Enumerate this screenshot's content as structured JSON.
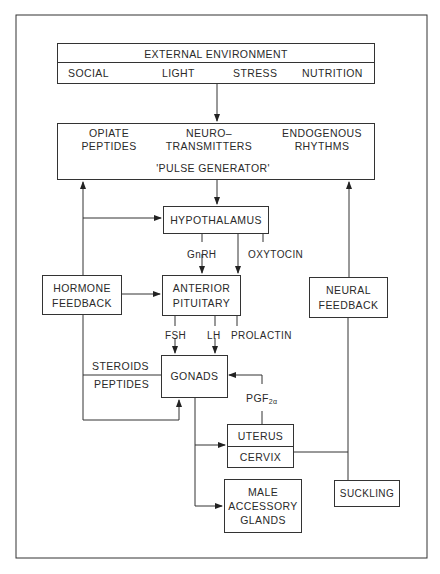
{
  "diagram": {
    "external_environment": {
      "title": "EXTERNAL ENVIRONMENT",
      "factors": [
        "SOCIAL",
        "LIGHT",
        "STRESS",
        "NUTRITION"
      ]
    },
    "pulse_generator": {
      "inputs": [
        {
          "line1": "OPIATE",
          "line2": "PEPTIDES"
        },
        {
          "line1": "NEURO–",
          "line2": "TRANSMITTERS"
        },
        {
          "line1": "ENDOGENOUS",
          "line2": "RHYTHMS"
        }
      ],
      "label": "'PULSE GENERATOR'"
    },
    "hypothalamus": "HYPOTHALAMUS",
    "hypothalamus_outputs": {
      "gnrh": "GnRH",
      "oxytocin": "OXYTOCIN"
    },
    "hormone_feedback": {
      "line1": "HORMONE",
      "line2": "FEEDBACK"
    },
    "anterior_pituitary": {
      "line1": "ANTERIOR",
      "line2": "PITUITARY"
    },
    "pituitary_outputs": {
      "fsh": "FSH",
      "lh": "LH",
      "prolactin": "PROLACTIN"
    },
    "neural_feedback": {
      "line1": "NEURAL",
      "line2": "FEEDBACK"
    },
    "gonad_outputs": {
      "steroids": "STEROIDS",
      "peptides": "PEPTIDES"
    },
    "gonads": "GONADS",
    "pgf": {
      "base": "PGF",
      "sub": "2α"
    },
    "uterus": "UTERUS",
    "cervix": "CERVIX",
    "male_accessory_glands": {
      "line1": "MALE",
      "line2": "ACCESSORY",
      "line3": "GLANDS"
    },
    "suckling": "SUCKLING"
  }
}
